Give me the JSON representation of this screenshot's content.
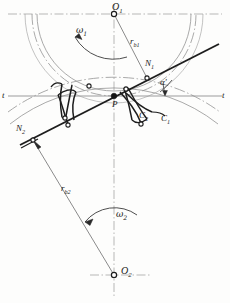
{
  "figure": {
    "background_color": "#fdfdfc",
    "line_color": "#2b2b2b",
    "thin_line_color": "#8a8a8a",
    "centerline_color": "#9a9a9a",
    "width": 230,
    "height": 303
  },
  "labels": {
    "center_upper": {
      "text": "O",
      "sub": "1",
      "x": 112,
      "y": 5
    },
    "center_lower": {
      "text": "O",
      "sub": "2",
      "x": 122,
      "y": 268
    },
    "omega_upper": {
      "text": "ω",
      "sub": "1",
      "x": 78,
      "y": 28
    },
    "omega_lower": {
      "text": "ω",
      "sub": "2",
      "x": 117,
      "y": 212
    },
    "radius_base_upper": {
      "text": "r",
      "sub": "b1",
      "x": 131,
      "y": 39
    },
    "radius_base_lower": {
      "text": "r",
      "sub": "b2",
      "x": 62,
      "y": 186
    },
    "point_n1": {
      "text": "N",
      "sub": "1",
      "x": 146,
      "y": 61
    },
    "point_n2": {
      "text": "N",
      "sub": "2",
      "x": 17,
      "y": 126
    },
    "point_p": {
      "text": "P",
      "x": 112,
      "y": 101
    },
    "curve_c1": {
      "text": "C",
      "sub": "1",
      "x": 162,
      "y": 116
    },
    "curve_c2": {
      "text": "C",
      "sub": "2",
      "x": 140,
      "y": 113
    },
    "pressure_angle": {
      "text": "α",
      "prime": "′",
      "x": 161,
      "y": 80
    },
    "tangent_left": {
      "text": "t",
      "x": 2,
      "y": 93
    },
    "tangent_right": {
      "text": "t",
      "x": 223,
      "y": 93
    }
  },
  "geometry": {
    "o1": {
      "x": 114,
      "y": 14
    },
    "o2": {
      "x": 114,
      "y": 275
    },
    "pitch_point": {
      "x": 114,
      "y": 96
    },
    "n1": {
      "x": 147,
      "y": 78
    },
    "n2": {
      "x": 32,
      "y": 138
    },
    "r_b1": 86,
    "r_b2": 155,
    "pressure_angle_deg": 20,
    "line_of_action_start": {
      "x": 23,
      "y": 143
    },
    "line_of_action_end": {
      "x": 218,
      "y": 45
    }
  },
  "elements": {
    "horizontal_centerline": "t-t tangent line through pitch point",
    "vertical_centerline": "line of centers O1-O2",
    "base_circle_1": "base circle of gear 1",
    "pitch_circle_1": "pitch circle of gear 1",
    "base_circle_2": "base circle of gear 2",
    "pitch_circle_2": "pitch circle of gear 2",
    "tooth_profile_1": "involute tooth flank of gear 1",
    "tooth_profile_2": "involute tooth flank of gear 2"
  }
}
